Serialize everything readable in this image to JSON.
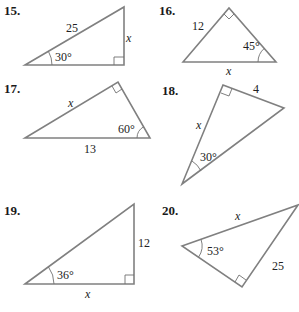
{
  "problems": [
    {
      "number": "15.",
      "hypotenuse": "25",
      "opposite": "x",
      "angle": "30°"
    },
    {
      "number": "16.",
      "leg": "12",
      "hypotenuse": "x",
      "angle": "45°"
    },
    {
      "number": "17.",
      "leg": "x",
      "hypotenuse": "13",
      "angle": "60°"
    },
    {
      "number": "18.",
      "leg_short": "4",
      "leg_long": "x",
      "angle": "30°"
    },
    {
      "number": "19.",
      "opposite": "12",
      "adjacent": "x",
      "angle": "36°"
    },
    {
      "number": "20.",
      "hypotenuse": "x",
      "leg": "25",
      "angle": "53°"
    }
  ]
}
